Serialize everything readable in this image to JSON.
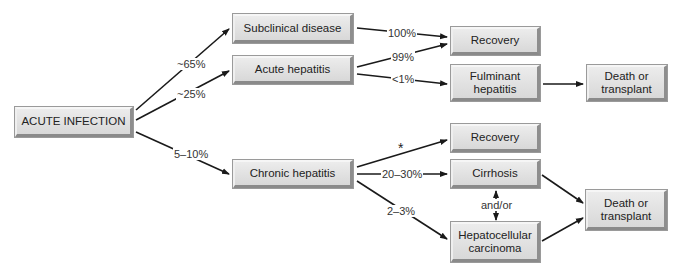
{
  "diagram": {
    "title": "",
    "nodes": {
      "acute_infection": {
        "label": "ACUTE INFECTION"
      },
      "subclinical": {
        "label": "Subclinical disease"
      },
      "acute_hepatitis": {
        "label": "Acute hepatitis"
      },
      "chronic_hepatitis": {
        "label": "Chronic hepatitis"
      },
      "recovery_top": {
        "label": "Recovery"
      },
      "fulminant": {
        "label": "Fulminant hepatitis"
      },
      "death_top": {
        "label": "Death or transplant"
      },
      "recovery_mid": {
        "label": "Recovery"
      },
      "cirrhosis": {
        "label": "Cirrhosis"
      },
      "hcc": {
        "label": "Hepatocellular carcinoma"
      },
      "death_bottom": {
        "label": "Death or transplant"
      }
    },
    "edge_labels": {
      "to_subclinical": "~65%",
      "to_acute": "~25%",
      "to_chronic": "5–10%",
      "subclinical_recovery": "100%",
      "acute_recovery": "99%",
      "acute_fulminant": "<1%",
      "chronic_recovery": "*",
      "chronic_cirrhosis": "20–30%",
      "chronic_hcc": "2–3%",
      "cirrhosis_hcc": "and/or"
    },
    "edges": [
      {
        "from": "ACUTE INFECTION",
        "to": "Subclinical disease",
        "label": "~65%"
      },
      {
        "from": "ACUTE INFECTION",
        "to": "Acute hepatitis",
        "label": "~25%"
      },
      {
        "from": "ACUTE INFECTION",
        "to": "Chronic hepatitis",
        "label": "5–10%"
      },
      {
        "from": "Subclinical disease",
        "to": "Recovery",
        "label": "100%"
      },
      {
        "from": "Acute hepatitis",
        "to": "Recovery",
        "label": "99%"
      },
      {
        "from": "Acute hepatitis",
        "to": "Fulminant hepatitis",
        "label": "<1%"
      },
      {
        "from": "Fulminant hepatitis",
        "to": "Death or transplant",
        "label": ""
      },
      {
        "from": "Chronic hepatitis",
        "to": "Recovery",
        "label": "*"
      },
      {
        "from": "Chronic hepatitis",
        "to": "Cirrhosis",
        "label": "20–30%"
      },
      {
        "from": "Chronic hepatitis",
        "to": "Hepatocellular carcinoma",
        "label": "2–3%"
      },
      {
        "from": "Cirrhosis",
        "to": "Hepatocellular carcinoma",
        "label": "and/or",
        "bidirectional": true
      },
      {
        "from": "Cirrhosis",
        "to": "Death or transplant",
        "label": ""
      },
      {
        "from": "Hepatocellular carcinoma",
        "to": "Death or transplant",
        "label": ""
      }
    ],
    "colors": {
      "box_fill": "#e2e2e2",
      "box_shadow": "#8a8a8a",
      "line": "#1a1a1a",
      "text": "#222222"
    }
  }
}
